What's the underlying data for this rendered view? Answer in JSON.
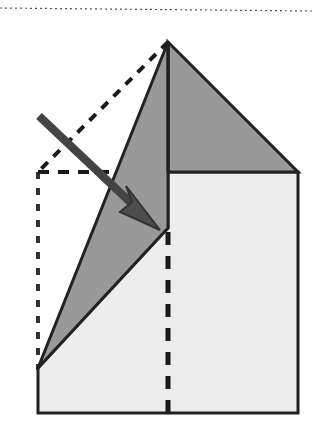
{
  "figure": {
    "canvas": {
      "width": 312,
      "height": 433,
      "background": "#ffffff"
    },
    "colors": {
      "outline": "#222222",
      "flap_fill": "#999999",
      "body_fill": "#ededed",
      "roof_fill": "#999999",
      "arrow": "#4d4d4d",
      "dashed": "#1a1a1a",
      "dotted": "#333333"
    },
    "shapes": {
      "top_rule": {
        "name": "top-dotted-rule",
        "x1": 0,
        "y1": 8,
        "x2": 312,
        "y2": 11,
        "stroke": "#555555",
        "stroke_width": 1.2,
        "dash": "2 3"
      },
      "body": {
        "name": "house-body-polygon",
        "points": "38,413 38,368 168,228 168,172 298,172 298,413",
        "fill": "#ededed",
        "stroke": "#222222",
        "stroke_width": 3
      },
      "roof": {
        "name": "roof-triangle",
        "points": "168,42 298,172 168,172",
        "fill": "#999999",
        "stroke": "#222222",
        "stroke_width": 3
      },
      "flap": {
        "name": "folding-flap-triangle",
        "points": "168,42 38,368 168,228",
        "fill": "#999999",
        "stroke": "#222222",
        "stroke_width": 3
      },
      "apex_spine": {
        "name": "apex-vertical-edge",
        "x1": 168,
        "y1": 42,
        "x2": 168,
        "y2": 172,
        "stroke": "#222222",
        "stroke_width": 3
      },
      "crease_vertical": {
        "name": "vertical-crease-dashed-line",
        "x1": 168,
        "y1": 232,
        "x2": 168,
        "y2": 413,
        "stroke": "#1a1a1a",
        "stroke_width": 5,
        "dash": "13 11"
      },
      "crease_diagonal": {
        "name": "diagonal-crease-dashed-line",
        "x1": 168,
        "y1": 42,
        "x2": 38,
        "y2": 172,
        "stroke": "#1a1a1a",
        "stroke_width": 4,
        "dash": "9 8"
      },
      "ghost_horizontal": {
        "name": "ghost-outline-horizontal-dashed-line",
        "x1": 38,
        "y1": 172,
        "x2": 176,
        "y2": 172,
        "stroke": "#1a1a1a",
        "stroke_width": 4,
        "dash": "11 9"
      },
      "ghost_vertical": {
        "name": "ghost-outline-vertical-dotted-line",
        "x1": 38,
        "y1": 172,
        "x2": 38,
        "y2": 370,
        "stroke": "#333333",
        "stroke_width": 4,
        "dash": "7 9"
      },
      "arrow": {
        "name": "fold-direction-arrow",
        "tail_x": 39,
        "tail_y": 116,
        "tip_x": 158,
        "tip_y": 228,
        "shaft_width": 7,
        "head_points": "158,228 122,204 134,199 131,185",
        "color": "#4d4d4d",
        "stroke": "#333333"
      }
    }
  }
}
